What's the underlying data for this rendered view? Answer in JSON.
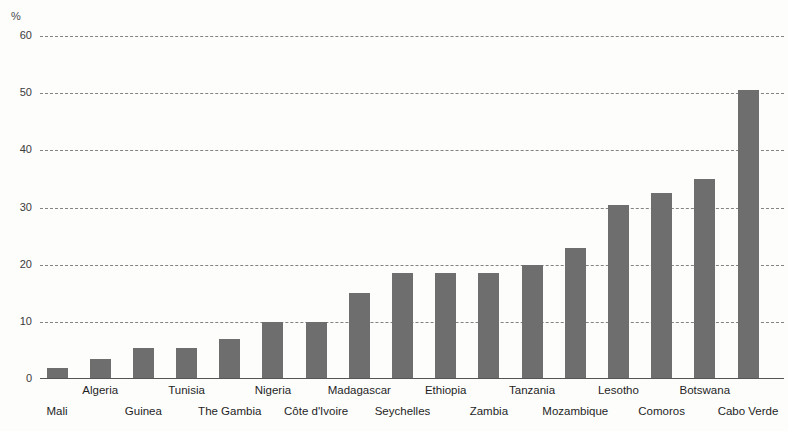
{
  "chart_data": {
    "type": "bar",
    "title": "",
    "subtitle": "",
    "xlabel": "",
    "ylabel": "",
    "unit_label": "%",
    "ylim": [
      0,
      60
    ],
    "yticks": [
      0,
      10,
      20,
      30,
      40,
      50,
      60
    ],
    "ytick_labels": [
      "0",
      "10",
      "20",
      "30",
      "40",
      "50",
      "60"
    ],
    "grid": true,
    "legend": null,
    "bar_color": "#6e6e6e",
    "categories": [
      "Mali",
      "Algeria",
      "Guinea",
      "Tunisia",
      "The Gambia",
      "Nigeria",
      "Côte d'Ivoire",
      "Madagascar",
      "Seychelles",
      "Ethiopia",
      "Zambia",
      "Tanzania",
      "Mozambique",
      "Lesotho",
      "Comoros",
      "Botswana",
      "Cabo Verde"
    ],
    "values": [
      2,
      3.5,
      5.5,
      5.5,
      7,
      10,
      10,
      15,
      18.5,
      18.5,
      18.5,
      20,
      23,
      30.5,
      32.5,
      35,
      50.5
    ]
  },
  "axis": {
    "unit": "%",
    "ticks": [
      {
        "label": "60",
        "value": 60
      },
      {
        "label": "50",
        "value": 50
      },
      {
        "label": "40",
        "value": 40
      },
      {
        "label": "30",
        "value": 30
      },
      {
        "label": "20",
        "value": 20
      },
      {
        "label": "10",
        "value": 10
      },
      {
        "label": "0",
        "value": 0
      }
    ]
  }
}
